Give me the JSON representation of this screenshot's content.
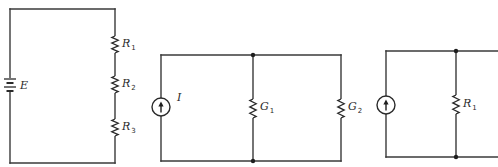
{
  "figure": {
    "width": 498,
    "height": 167,
    "colors": {
      "wire": "#3a3a3a",
      "background": "#ffffff"
    }
  },
  "circuits": [
    {
      "id": "series-circuit",
      "description": "Voltage source E in series with resistors R1, R2, R3",
      "frame": {
        "left": 10,
        "top": 9,
        "right": 115,
        "bottom": 163
      },
      "source": {
        "type": "battery",
        "x": 10,
        "y": 85,
        "label": "E"
      },
      "resistors": [
        {
          "x": 115,
          "y1": 36,
          "y2": 53,
          "label": "R",
          "sub": "1"
        },
        {
          "x": 115,
          "y1": 76,
          "y2": 93,
          "label": "R",
          "sub": "2"
        },
        {
          "x": 115,
          "y1": 119,
          "y2": 136,
          "label": "R",
          "sub": "3"
        }
      ]
    },
    {
      "id": "parallel-circuit-conductance",
      "description": "Current source I in parallel with conductances G1 and G2",
      "frame": {
        "left": 161,
        "top": 55,
        "right": 341,
        "bottom": 161
      },
      "source": {
        "type": "current",
        "x": 161,
        "y": 107,
        "r": 9,
        "label": "I"
      },
      "nodes": [
        {
          "x": 253,
          "y": 55
        },
        {
          "x": 253,
          "y": 161
        }
      ],
      "resistors": [
        {
          "x": 253,
          "y1": 99,
          "y2": 118,
          "label": "G",
          "sub": "1"
        },
        {
          "x": 341,
          "y1": 99,
          "y2": 118,
          "label": "G",
          "sub": "2"
        }
      ]
    },
    {
      "id": "parallel-circuit-resistance",
      "description": "Current source in parallel with R1 (continues off right edge)",
      "frame": {
        "left": 386,
        "top": 51,
        "right": 498,
        "bottom": 157
      },
      "source": {
        "type": "current",
        "x": 386,
        "y": 105,
        "r": 9,
        "label": ""
      },
      "nodes": [
        {
          "x": 456,
          "y": 51
        },
        {
          "x": 456,
          "y": 157
        }
      ],
      "resistors": [
        {
          "x": 456,
          "y1": 95,
          "y2": 114,
          "label": "R",
          "sub": "1"
        }
      ]
    }
  ]
}
